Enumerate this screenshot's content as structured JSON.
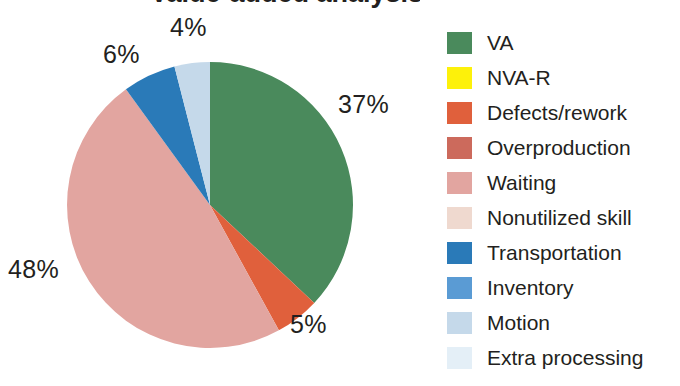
{
  "figure": {
    "title_partial": "Value-added analysis",
    "background_color": "#ffffff",
    "text_color": "#231f20"
  },
  "chart_data": {
    "type": "pie",
    "title": "",
    "xlabel": "",
    "ylabel": "",
    "legend_position": "right",
    "grid": false,
    "units": "percent",
    "start_angle_deg": 0,
    "direction": "clockwise",
    "categories": [
      "VA",
      "NVA-R",
      "Defects/rework",
      "Overproduction",
      "Waiting",
      "Nonutilized skill",
      "Transportation",
      "Inventory",
      "Motion",
      "Extra processing"
    ],
    "values": [
      37,
      0,
      5,
      0,
      48,
      0,
      6,
      0,
      4,
      0
    ],
    "colors": [
      "#4a8a5c",
      "#fdf10a",
      "#e0603c",
      "#cc6a5c",
      "#e2a5a0",
      "#efd9cf",
      "#2a7ab8",
      "#5a9bd4",
      "#c5d9ea",
      "#e4eff7"
    ],
    "labels_shown": [
      {
        "text": "37%",
        "category": "VA",
        "value": 37
      },
      {
        "text": "5%",
        "category": "Defects/rework",
        "value": 5
      },
      {
        "text": "48%",
        "category": "Waiting",
        "value": 48
      },
      {
        "text": "6%",
        "category": "Transportation",
        "value": 6
      },
      {
        "text": "4%",
        "category": "Motion",
        "value": 4
      }
    ]
  },
  "legend": {
    "items": [
      {
        "label": "VA",
        "color": "#4a8a5c"
      },
      {
        "label": "NVA-R",
        "color": "#fdf10a"
      },
      {
        "label": "Defects/rework",
        "color": "#e0603c"
      },
      {
        "label": "Overproduction",
        "color": "#cc6a5c"
      },
      {
        "label": "Waiting",
        "color": "#e2a5a0"
      },
      {
        "label": "Nonutilized skill",
        "color": "#efd9cf"
      },
      {
        "label": "Transportation",
        "color": "#2a7ab8"
      },
      {
        "label": "Inventory",
        "color": "#5a9bd4"
      },
      {
        "label": "Motion",
        "color": "#c5d9ea"
      },
      {
        "label": "Extra processing",
        "color": "#e4eff7"
      }
    ]
  }
}
